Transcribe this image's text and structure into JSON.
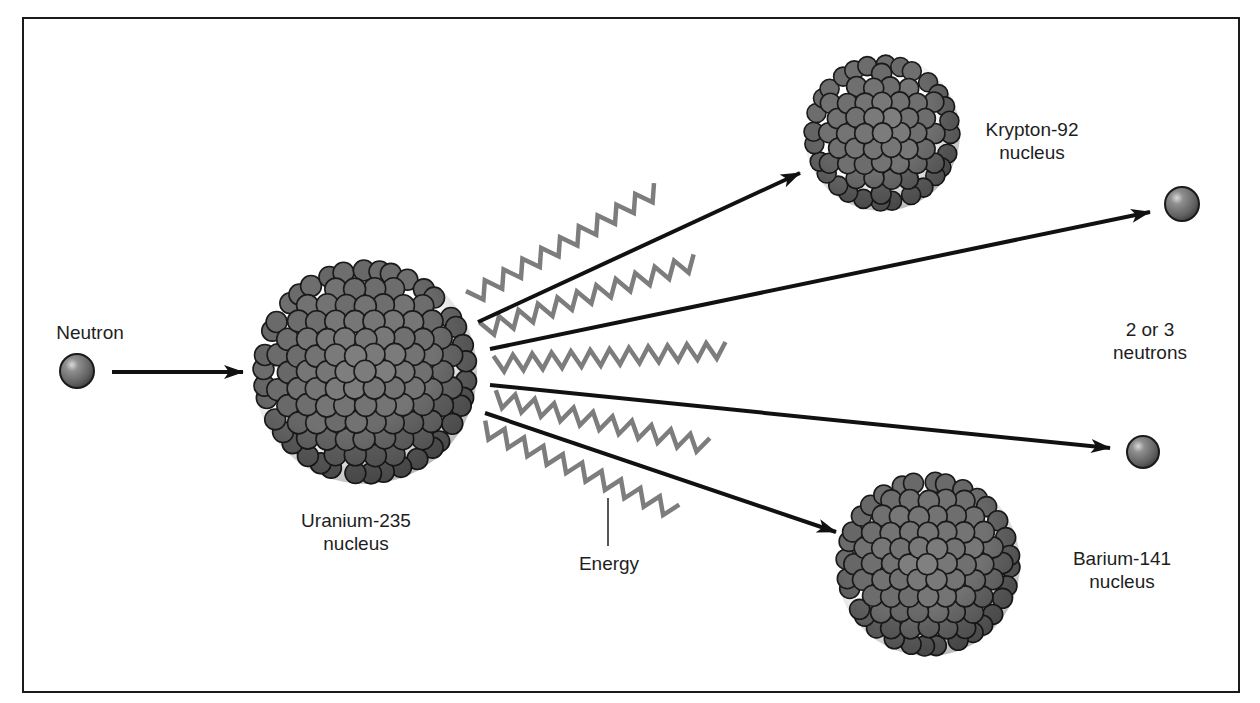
{
  "colors": {
    "background": "#ffffff",
    "frame": "#1a1a1a",
    "arrow": "#111111",
    "wave": "#7d7d7d",
    "nucleon_fill": "#7a7a7a",
    "nucleon_stroke": "#1a1a1a",
    "text": "#1e1e1e"
  },
  "labels": {
    "neutron": {
      "line1": "Neutron",
      "x": 90,
      "y": 321
    },
    "uranium": {
      "line1": "Uranium-235",
      "line2": "nucleus",
      "x": 356,
      "y": 509
    },
    "energy": {
      "line1": "Energy",
      "x": 609,
      "y": 552
    },
    "krypton": {
      "line1": "Krypton-92",
      "line2": "nucleus",
      "x": 1032,
      "y": 118
    },
    "neutrons_out": {
      "line1": "2 or 3",
      "line2": "neutrons",
      "x": 1150,
      "y": 318
    },
    "barium": {
      "line1": "Barium-141",
      "line2": "nucleus",
      "x": 1122,
      "y": 547
    }
  },
  "nuclei": [
    {
      "id": "uranium-235",
      "cx": 365,
      "cy": 372,
      "r": 112,
      "nucleon_r": 11
    },
    {
      "id": "krypton-92",
      "cx": 882,
      "cy": 133,
      "r": 78,
      "nucleon_r": 10
    },
    {
      "id": "barium-141",
      "cx": 928,
      "cy": 564,
      "r": 92,
      "nucleon_r": 10.5
    }
  ],
  "neutrons": [
    {
      "id": "incoming-neutron",
      "cx": 77,
      "cy": 371,
      "r": 17
    },
    {
      "id": "outgoing-neutron-1",
      "cx": 1182,
      "cy": 204,
      "r": 17
    },
    {
      "id": "outgoing-neutron-2",
      "cx": 1143,
      "cy": 452,
      "r": 16
    }
  ],
  "arrows": [
    {
      "id": "neutron-to-uranium",
      "x1": 112,
      "y1": 372,
      "x2": 243,
      "y2": 372
    },
    {
      "id": "to-krypton",
      "x1": 478,
      "y1": 322,
      "x2": 800,
      "y2": 173
    },
    {
      "id": "to-neutron-1",
      "x1": 490,
      "y1": 349,
      "x2": 1150,
      "y2": 212
    },
    {
      "id": "to-neutron-2",
      "x1": 490,
      "y1": 385,
      "x2": 1110,
      "y2": 448
    },
    {
      "id": "to-barium",
      "x1": 485,
      "y1": 413,
      "x2": 836,
      "y2": 532
    }
  ],
  "waves": [
    {
      "id": "energy-wave-1",
      "x1": 470,
      "y1": 298,
      "x2": 658,
      "y2": 190,
      "cycles": 10,
      "amp": 8
    },
    {
      "id": "energy-wave-2",
      "x1": 482,
      "y1": 330,
      "x2": 696,
      "y2": 262,
      "cycles": 11,
      "amp": 8
    },
    {
      "id": "energy-wave-3",
      "x1": 494,
      "y1": 364,
      "x2": 726,
      "y2": 350,
      "cycles": 12,
      "amp": 8
    },
    {
      "id": "energy-wave-4",
      "x1": 494,
      "y1": 398,
      "x2": 708,
      "y2": 446,
      "cycles": 11,
      "amp": 8
    },
    {
      "id": "energy-wave-5",
      "x1": 482,
      "y1": 428,
      "x2": 676,
      "y2": 512,
      "cycles": 10,
      "amp": 8
    }
  ],
  "energy_pointer": {
    "x": 608,
    "y1": 498,
    "y2": 546
  }
}
